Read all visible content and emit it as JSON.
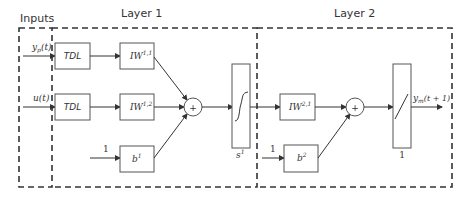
{
  "diagram": {
    "sections": {
      "inputs": "Inputs",
      "layer1": "Layer 1",
      "layer2": "Layer 2"
    },
    "inputs": [
      {
        "id": "yp",
        "label_main": "y",
        "label_sub": "p",
        "label_arg": "(t)"
      },
      {
        "id": "u",
        "label_main": "u",
        "label_sub": "",
        "label_arg": "(t)"
      }
    ],
    "layer1": {
      "tdl_blocks": [
        {
          "label": "TDL"
        },
        {
          "label": "TDL"
        }
      ],
      "weights": [
        {
          "label": "IW",
          "sup": "1,1"
        },
        {
          "label": "IW",
          "sup": "1,2"
        }
      ],
      "bias": {
        "input": "1",
        "label": "b",
        "sup": "1"
      },
      "sum_symbol": "+",
      "transfer": {
        "label": "s",
        "sup": "1",
        "type": "sigmoid"
      }
    },
    "layer2": {
      "weight": {
        "label": "IW",
        "sup": "2,1"
      },
      "bias": {
        "input": "1",
        "label": "b",
        "sup": "2"
      },
      "sum_symbol": "+",
      "transfer": {
        "label": "1",
        "type": "linear"
      },
      "output": {
        "label_main": "y",
        "label_sub": "m",
        "label_arg": "(t + 1)"
      }
    },
    "colors": {
      "line": "#333333",
      "box_stroke": "#555555",
      "background": "#ffffff"
    }
  }
}
